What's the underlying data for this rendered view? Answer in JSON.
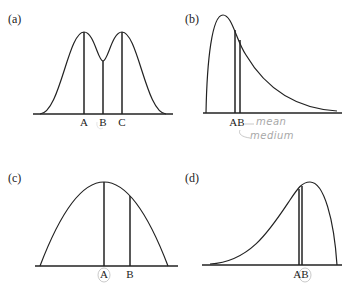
{
  "panels": [
    {
      "id": "a",
      "label": "(a)",
      "shape": "bimodal symmetric",
      "markers": [
        {
          "label": "A",
          "x": 84
        },
        {
          "label": "B",
          "x": 103
        },
        {
          "label": "C",
          "x": 122
        }
      ]
    },
    {
      "id": "b",
      "label": "(b)",
      "shape": "right-skewed",
      "markers": [
        {
          "label": "A",
          "x": 235
        },
        {
          "label": "B",
          "x": 240
        }
      ],
      "annotations": [
        "mean",
        "medium"
      ]
    },
    {
      "id": "c",
      "label": "(c)",
      "shape": "symmetric unimodal",
      "markers": [
        {
          "label": "A",
          "x": 104,
          "circled": true
        },
        {
          "label": "B",
          "x": 130
        }
      ]
    },
    {
      "id": "d",
      "label": "(d)",
      "shape": "left-skewed",
      "markers": [
        {
          "label": "A",
          "x": 299
        },
        {
          "label": "B",
          "x": 303,
          "circled": true
        }
      ]
    }
  ],
  "labels": {
    "a": "(a)",
    "b": "(b)",
    "c": "(c)",
    "d": "(d)",
    "a_A": "A",
    "a_B": "B",
    "a_C": "C",
    "b_AB": "AB",
    "b_note1": "mean",
    "b_note2": "medium",
    "c_A": "A",
    "c_B": "B",
    "d_AB": "AB"
  }
}
